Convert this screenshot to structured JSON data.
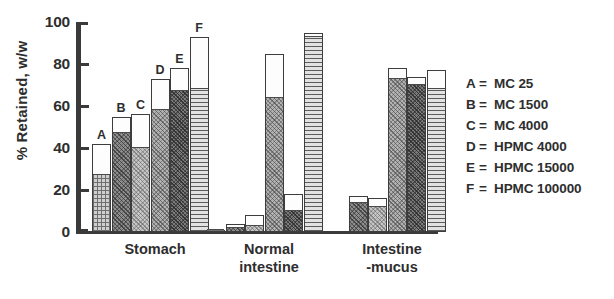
{
  "chart_data": {
    "type": "bar",
    "title": "",
    "subtitle": "",
    "xlabel": "",
    "ylabel": "% Retained, w/w",
    "ylim": [
      0,
      100
    ],
    "yticks": [
      0,
      20,
      40,
      60,
      80,
      100
    ],
    "grid": false,
    "legend_position": "right",
    "categories": [
      "Stomach",
      "Normal intestine",
      "Intestine -mucus"
    ],
    "series": [
      {
        "name": "A",
        "legend": "MC 25",
        "values": [
          42,
          1,
          0
        ],
        "fill_values": [
          27,
          1,
          0
        ]
      },
      {
        "name": "B",
        "legend": "MC 1500",
        "values": [
          55,
          4,
          17
        ],
        "fill_values": [
          47,
          2,
          14
        ]
      },
      {
        "name": "C",
        "legend": "MC 4000",
        "values": [
          56,
          8,
          16
        ],
        "fill_values": [
          40,
          3,
          12
        ]
      },
      {
        "name": "D",
        "legend": "HPMC 4000",
        "values": [
          73,
          85,
          78
        ],
        "fill_values": [
          58,
          64,
          73
        ]
      },
      {
        "name": "E",
        "legend": "HPMC 15000",
        "values": [
          78,
          18,
          74
        ],
        "fill_values": [
          67,
          10,
          70
        ]
      },
      {
        "name": "F",
        "legend": "HPMC 100000",
        "values": [
          93,
          95,
          77
        ],
        "fill_values": [
          68,
          93,
          68
        ]
      }
    ],
    "bar_labels_shown_on_group": "Stomach",
    "annotations": []
  },
  "axis": {
    "y_tick_labels": [
      "100",
      "80",
      "60",
      "40",
      "20",
      "0"
    ],
    "y_axis_title": "% Retained, w/w"
  },
  "x_categories": [
    {
      "label": "Stomach"
    },
    {
      "label": "Normal\nintestine"
    },
    {
      "label": "Intestine\n-mucus"
    }
  ],
  "bar_labels": [
    "A",
    "B",
    "C",
    "D",
    "E",
    "F"
  ],
  "legend": {
    "rows": [
      {
        "key": "A",
        "eq": "=",
        "value": "MC 25"
      },
      {
        "key": "B",
        "eq": "=",
        "value": "MC 1500"
      },
      {
        "key": "C",
        "eq": "=",
        "value": "MC 4000"
      },
      {
        "key": "D",
        "eq": "=",
        "value": "HPMC 4000"
      },
      {
        "key": "E",
        "eq": "=",
        "value": "HPMC 15000"
      },
      {
        "key": "F",
        "eq": "=",
        "value": "HPMC 100000"
      }
    ]
  },
  "colors": {
    "ink": "#2e2e2e",
    "axis": "#3a3a3a",
    "bar_outline": "#3d3d3d",
    "bar_top_white": "#fdfdfd",
    "background": "#ffffff"
  }
}
